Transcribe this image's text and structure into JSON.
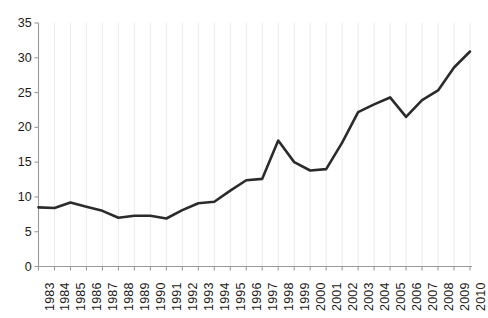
{
  "chart_data": {
    "type": "line",
    "title": "",
    "subtitle": "",
    "xlabel": "",
    "ylabel": "",
    "categories": [
      "1983",
      "1984",
      "1985",
      "1986",
      "1987",
      "1988",
      "1989",
      "1990",
      "1991",
      "1992",
      "1993",
      "1994",
      "1995",
      "1996",
      "1997",
      "1998",
      "1999",
      "2000",
      "2001",
      "2002",
      "2003",
      "2004",
      "2005",
      "2006",
      "2007",
      "2008",
      "2009",
      "2010"
    ],
    "values": [
      8.5,
      8.4,
      9.2,
      8.6,
      8.0,
      7.0,
      7.3,
      7.3,
      6.9,
      8.1,
      9.1,
      9.3,
      10.9,
      12.4,
      12.6,
      18.1,
      15.0,
      13.8,
      14.0,
      17.8,
      22.2,
      23.3,
      24.3,
      21.5,
      23.9,
      25.3,
      28.6,
      30.9
    ],
    "ylim": [
      0,
      35
    ],
    "yticks": [
      0,
      5,
      10,
      15,
      20,
      25,
      30,
      35
    ],
    "ytick_labels": [
      "0",
      "5",
      "10",
      "15",
      "20",
      "25",
      "30",
      "35"
    ],
    "xtick_labels": [
      "1983",
      "1984",
      "1985",
      "1986",
      "1987",
      "1988",
      "1989",
      "1990",
      "1991",
      "1992",
      "1993",
      "1994",
      "1995",
      "1996",
      "1997",
      "1998",
      "1999",
      "2000",
      "2001",
      "2002",
      "2003",
      "2004",
      "2005",
      "2006",
      "2007",
      "2008",
      "2009",
      "2010"
    ],
    "grid": {
      "vertical": true,
      "horizontal": false,
      "color": "#ececec"
    },
    "legend": null,
    "legend_position": "none",
    "series": [
      {
        "name": "series-1",
        "color": "#2b2b2b",
        "line_width": 2.6,
        "values": [
          8.5,
          8.4,
          9.2,
          8.6,
          8.0,
          7.0,
          7.3,
          7.3,
          6.9,
          8.1,
          9.1,
          9.3,
          10.9,
          12.4,
          12.6,
          18.1,
          15.0,
          13.8,
          14.0,
          17.8,
          22.2,
          23.3,
          24.3,
          21.5,
          23.9,
          25.3,
          28.6,
          30.9
        ]
      }
    ],
    "annotations": []
  },
  "style": {
    "axis_color": "#9a9a9a",
    "tick_color": "#9a9a9a",
    "text_color": "#1a1a1a",
    "background": "#ffffff",
    "line_color": "#2b2b2b"
  },
  "caption": {
    "text": ""
  }
}
